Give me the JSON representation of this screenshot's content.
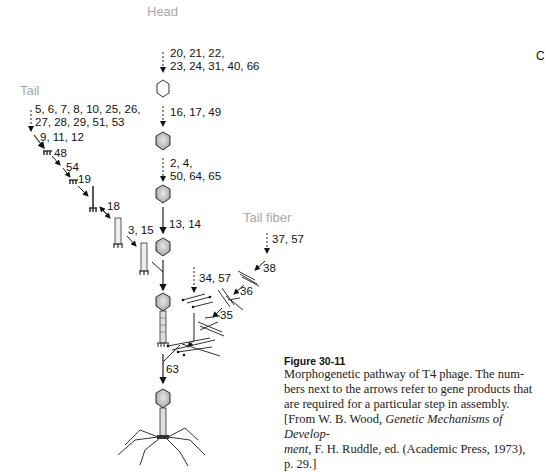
{
  "labels": {
    "head": "Head",
    "tail": "Tail",
    "tail_fiber": "Tail fiber",
    "edge_partial": "C"
  },
  "genes": {
    "head_step1_line1": "20, 21, 22,",
    "head_step1_line2": "23, 24, 31, 40, 66",
    "head_step2": "16, 17, 49",
    "head_step3_line1": "2, 4,",
    "head_step3_line2": "50, 64, 65",
    "head_step4": "13, 14",
    "tail_step1_line1": "5, 6, 7, 8, 10, 25, 26,",
    "tail_step1_line2": "27, 28, 29, 51, 53",
    "tail_step2": "9, 11, 12",
    "tail_step3": "48",
    "tail_step4": "54",
    "tail_step5": "19",
    "tail_step6": "18",
    "tail_step7": "3, 15",
    "fiber_step1": "37, 57",
    "fiber_step2": "38",
    "fiber_step3": "36",
    "fiber_step4": "35",
    "fiber_step5": "34, 57",
    "final_step": "63"
  },
  "caption": {
    "title": "Figure 30-11",
    "line1": "Morphogenetic pathway of T4 phage. The num-",
    "line2": "bers next to the arrows refer to gene products that",
    "line3": "are required for a particular step in assembly.",
    "line4_pre": "[From W. B. Wood, ",
    "line4_ital": "Genetic Mechanisms of Develop-",
    "line5_ital": "ment,",
    "line5_post": " F. H. Ruddle, ed. (Academic Press, 1973),",
    "line6": "p. 29.]"
  }
}
